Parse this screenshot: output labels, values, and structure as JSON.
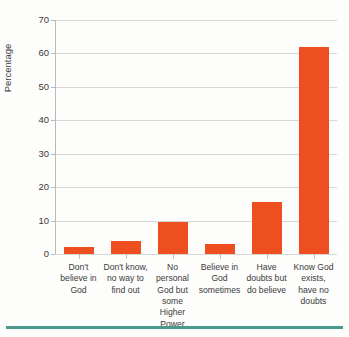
{
  "figure": {
    "top_cropped_text": "· ·      ·                ·",
    "bottom_rule_color": "#4a9b8e",
    "bar_color": "#ee4f20",
    "gridline_color": "#d8d8d6"
  },
  "chart_data": {
    "type": "bar",
    "title": "",
    "xlabel": "",
    "ylabel": "Percentage",
    "ylim": [
      0,
      70
    ],
    "yticks": [
      0,
      10,
      20,
      30,
      40,
      50,
      60,
      70
    ],
    "ytick_labels": [
      "0",
      "10",
      "20",
      "30",
      "40",
      "50",
      "60",
      "70"
    ],
    "grid": "horizontal",
    "legend": "none",
    "categories": [
      "Don't believe in God",
      "Don't know, no way to find out",
      "No personal God but some Higher Power",
      "Believe in God sometimes",
      "Have doubts but do believe",
      "Know God exists, have no doubts"
    ],
    "values": [
      2,
      4,
      9.5,
      3,
      15.5,
      62
    ]
  }
}
